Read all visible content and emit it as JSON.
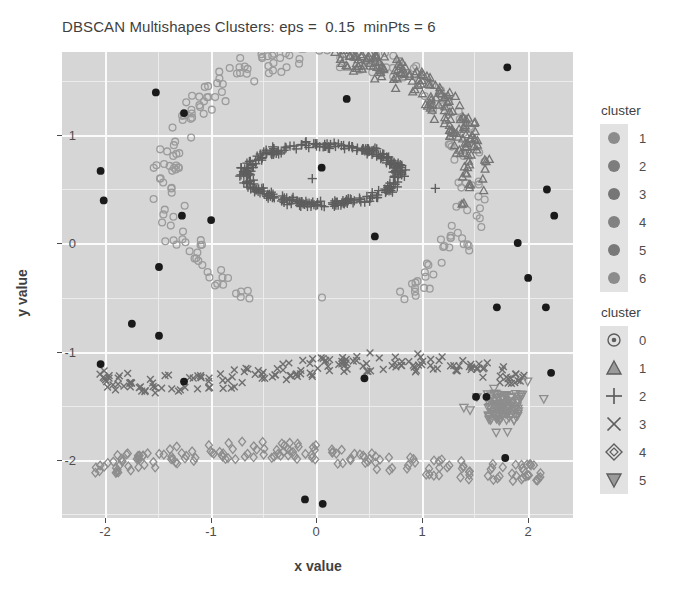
{
  "chart_data": {
    "type": "scatter",
    "title": "DBSCAN Multishapes Clusters: eps =  0.15  minPts = 6",
    "xlabel": "x value",
    "ylabel": "y value",
    "xlim": [
      -2.45,
      2.45
    ],
    "ylim": [
      -2.55,
      1.72
    ],
    "xticks": [
      -2,
      -1,
      0,
      1,
      2
    ],
    "xtick_labels": [
      "-2",
      "-1",
      "0",
      "1",
      "2"
    ],
    "yticks": [
      1,
      0,
      -1,
      -2
    ],
    "ytick_labels": [
      "1",
      "0",
      "-1",
      "-2"
    ],
    "grid": true,
    "grid_major": true,
    "grid_minor": true,
    "panel_background": "#d6d6d6",
    "grid_color": "#fbfbfb",
    "legend_position": "right",
    "series": [
      {
        "name": "0",
        "cluster": 0,
        "shape": "circle-open-dot",
        "color": "#1a1a1a",
        "description": "noise points scattered across panel",
        "points": [
          [
            -1.55,
            1.35
          ],
          [
            0.28,
            1.29
          ],
          [
            1.82,
            1.58
          ],
          [
            -1.28,
            1.16
          ],
          [
            -2.08,
            0.63
          ],
          [
            -2.05,
            0.36
          ],
          [
            -1.3,
            0.22
          ],
          [
            -1.02,
            0.18
          ],
          [
            2.27,
            0.22
          ],
          [
            2.2,
            0.46
          ],
          [
            0.55,
            0.03
          ],
          [
            0.04,
            0.66
          ],
          [
            -1.52,
            -0.25
          ],
          [
            1.92,
            -0.03
          ],
          [
            2.02,
            -0.35
          ],
          [
            2.19,
            -0.62
          ],
          [
            -1.78,
            -0.77
          ],
          [
            -1.52,
            -0.88
          ],
          [
            1.72,
            -0.62
          ],
          [
            -2.08,
            -1.14
          ],
          [
            -1.28,
            -1.3
          ],
          [
            0.45,
            -1.27
          ],
          [
            1.52,
            -1.44
          ],
          [
            1.62,
            -1.44
          ],
          [
            2.24,
            -1.22
          ],
          [
            0.05,
            -2.42
          ],
          [
            -0.12,
            -2.38
          ],
          [
            1.8,
            -2.0
          ]
        ]
      },
      {
        "name": "1",
        "cluster": 1,
        "shape": "triangle",
        "color": "#6e6e6e",
        "description": "upper right arc"
      },
      {
        "name": "2",
        "cluster": 2,
        "shape": "plus",
        "color": "#5a5a5a",
        "description": "inner ellipse ring centred near (0.05, 0.6)"
      },
      {
        "name": "3",
        "cluster": 3,
        "shape": "cross-x",
        "color": "#6e6e6e",
        "description": "horizontal wavy band near y = -1.2"
      },
      {
        "name": "4",
        "cluster": 4,
        "shape": "diamond",
        "color": "#8a8a8a",
        "description": "horizontal wavy band near y = -2.0"
      },
      {
        "name": "5",
        "cluster": 5,
        "shape": "triangle-down",
        "color": "#8a8a8a",
        "description": "dense blob near (1.8, -1.5)"
      },
      {
        "name": "outer-ring",
        "cluster": 1,
        "shape": "circle-open",
        "color": "#9a9a9a",
        "description": "large open circle ring surrounding inner ellipse"
      }
    ]
  },
  "legends": [
    {
      "title": "cluster",
      "key_type": "color",
      "items": [
        {
          "label": "1",
          "color": "#8c8c8c"
        },
        {
          "label": "2",
          "color": "#7d7d7d"
        },
        {
          "label": "3",
          "color": "#767676"
        },
        {
          "label": "4",
          "color": "#828282"
        },
        {
          "label": "5",
          "color": "#797979"
        },
        {
          "label": "6",
          "color": "#8c8c8c"
        }
      ]
    },
    {
      "title": "cluster",
      "key_type": "shape",
      "items": [
        {
          "label": "0",
          "shape": "circle-open-dot"
        },
        {
          "label": "1",
          "shape": "triangle"
        },
        {
          "label": "2",
          "shape": "plus"
        },
        {
          "label": "3",
          "shape": "cross-x"
        },
        {
          "label": "4",
          "shape": "diamond"
        },
        {
          "label": "5",
          "shape": "triangle-down"
        }
      ]
    }
  ]
}
